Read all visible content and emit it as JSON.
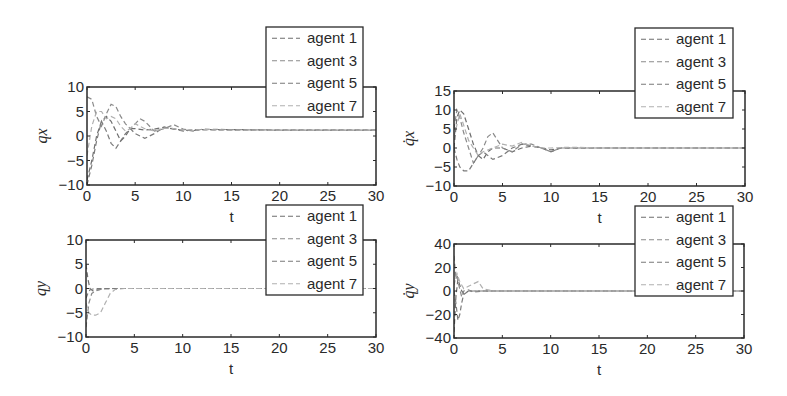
{
  "figure": {
    "background": "#ffffff",
    "axis_color": "#2a2a2a"
  },
  "chart_data": [
    {
      "type": "line",
      "id": "qx",
      "title": "",
      "xlabel": "t",
      "ylabel": "qx",
      "xlim": [
        0,
        30
      ],
      "ylim": [
        -10,
        10
      ],
      "xticks": [
        0,
        5,
        10,
        15,
        20,
        25,
        30
      ],
      "yticks": [
        -10,
        -5,
        0,
        5,
        10
      ],
      "xtick_labels": [
        "0",
        "5",
        "10",
        "15",
        "20",
        "25",
        "30"
      ],
      "ytick_labels": [
        "−10",
        "−5",
        "0",
        "5",
        "10"
      ],
      "grid": false,
      "legend_position": "top-right (overflowing above axes)",
      "box": {
        "left": 87,
        "top": 87,
        "right": 376,
        "bottom": 185
      },
      "legend_box": {
        "left": 266,
        "top": 27,
        "right": 363,
        "bottom": 117
      },
      "series": [
        {
          "name": "agent 1",
          "color": "#6e6e6e",
          "style": "dashed",
          "x": [
            0,
            0.5,
            1,
            1.5,
            2,
            2.5,
            3,
            3.5,
            4,
            4.5,
            5,
            6,
            7,
            8,
            9,
            10,
            11,
            12,
            15,
            20,
            30
          ],
          "y": [
            -9,
            -5,
            0,
            3,
            4,
            3,
            1,
            -1,
            0,
            1.5,
            1.5,
            1.2,
            1.4,
            1.8,
            1.4,
            1.2,
            1.1,
            1.3,
            1.3,
            1.2,
            1.2
          ]
        },
        {
          "name": "agent 3",
          "color": "#8a8a8a",
          "style": "dashed",
          "x": [
            0,
            0.5,
            1,
            1.5,
            2,
            2.5,
            3,
            3.5,
            4,
            4.5,
            5,
            5.5,
            6,
            7,
            8,
            9,
            10,
            11,
            12,
            15,
            20,
            30
          ],
          "y": [
            8,
            7.5,
            4,
            2,
            4.5,
            6.5,
            6,
            4,
            2.5,
            1.5,
            2.5,
            3.5,
            3,
            1,
            1.5,
            2.3,
            1.4,
            1.0,
            1.4,
            1.3,
            1.2,
            1.2
          ]
        },
        {
          "name": "agent 5",
          "color": "#7a7a7a",
          "style": "dashed",
          "x": [
            0,
            0.5,
            1,
            1.5,
            2,
            2.5,
            3,
            3.5,
            4,
            4.5,
            5,
            6,
            7,
            8,
            9,
            10,
            11,
            12,
            15,
            20,
            30
          ],
          "y": [
            -10,
            -6,
            -1,
            3,
            1,
            -1.5,
            -2.5,
            -1,
            0.5,
            1.5,
            0.5,
            -0.5,
            0.5,
            1.8,
            1.5,
            1.0,
            1.3,
            1.3,
            1.2,
            1.2,
            1.2
          ]
        },
        {
          "name": "agent 7",
          "color": "#b0b0b0",
          "style": "dashed",
          "x": [
            0,
            0.5,
            1,
            1.5,
            2,
            2.5,
            3,
            3.5,
            4,
            4.5,
            5,
            6,
            7,
            8,
            9,
            10,
            12,
            15,
            20,
            30
          ],
          "y": [
            -4,
            2,
            5,
            5,
            3.5,
            4,
            3.5,
            2,
            1,
            1.5,
            2.5,
            1.5,
            1.0,
            1.6,
            1.5,
            1.2,
            1.3,
            1.2,
            1.2,
            1.2
          ]
        }
      ]
    },
    {
      "type": "line",
      "id": "qdotx",
      "title": "",
      "xlabel": "t",
      "ylabel": "q̇x",
      "xlim": [
        0,
        30
      ],
      "ylim": [
        -10,
        15
      ],
      "xticks": [
        0,
        5,
        10,
        15,
        20,
        25,
        30
      ],
      "yticks": [
        -10,
        -5,
        0,
        5,
        10,
        15
      ],
      "xtick_labels": [
        "0",
        "5",
        "10",
        "15",
        "20",
        "25",
        "30"
      ],
      "ytick_labels": [
        "−10",
        "−5",
        "0",
        "5",
        "10",
        "15"
      ],
      "grid": false,
      "legend_position": "top-right (overflowing above axes)",
      "box": {
        "left": 454,
        "top": 91,
        "right": 745,
        "bottom": 186
      },
      "legend_box": {
        "left": 635,
        "top": 28,
        "right": 733,
        "bottom": 118
      },
      "series": [
        {
          "name": "agent 1",
          "color": "#6e6e6e",
          "style": "dashed",
          "x": [
            0,
            0.3,
            0.6,
            1,
            1.5,
            2,
            2.5,
            3,
            3.5,
            4,
            5,
            6,
            7,
            8,
            9,
            10,
            11,
            12,
            15,
            20,
            30
          ],
          "y": [
            0,
            8,
            10,
            9,
            5,
            1,
            -2,
            -3,
            -1,
            0,
            0,
            -1,
            0,
            0.5,
            0,
            -0.5,
            0,
            0,
            0,
            0,
            0
          ]
        },
        {
          "name": "agent 3",
          "color": "#8a8a8a",
          "style": "dashed",
          "x": [
            0,
            0.3,
            0.6,
            1,
            1.5,
            2,
            2.5,
            3,
            3.5,
            4,
            4.5,
            5,
            6,
            7,
            8,
            9,
            10,
            11,
            12,
            15,
            20,
            30
          ],
          "y": [
            5,
            10,
            8,
            4,
            0,
            -4,
            -2,
            0,
            3,
            4,
            2,
            0,
            -1,
            1,
            1,
            0,
            -1,
            0,
            0,
            0,
            0,
            0
          ]
        },
        {
          "name": "agent 5",
          "color": "#7a7a7a",
          "style": "dashed",
          "x": [
            0,
            0.3,
            0.6,
            1,
            1.5,
            2,
            2.5,
            3,
            4,
            5,
            6,
            7,
            8,
            9,
            10,
            11,
            12,
            15,
            20,
            30
          ],
          "y": [
            0,
            -3,
            -5,
            -6,
            -6,
            -4,
            -2,
            -1,
            -3,
            -2,
            0,
            1,
            0.5,
            0,
            -1,
            0,
            0,
            0,
            0,
            0
          ]
        },
        {
          "name": "agent 7",
          "color": "#b0b0b0",
          "style": "dashed",
          "x": [
            0,
            0.3,
            0.6,
            1,
            1.5,
            2,
            2.5,
            3,
            4,
            5,
            6,
            7,
            8,
            9,
            10,
            12,
            15,
            20,
            30
          ],
          "y": [
            3,
            6,
            9,
            6,
            2,
            0,
            -2,
            -1,
            0,
            1,
            0.5,
            1.5,
            0.5,
            0,
            0,
            0.2,
            0,
            0,
            0
          ]
        }
      ]
    },
    {
      "type": "line",
      "id": "qy",
      "title": "",
      "xlabel": "t",
      "ylabel": "qy",
      "xlim": [
        0,
        30
      ],
      "ylim": [
        -10,
        10
      ],
      "xticks": [
        0,
        5,
        10,
        15,
        20,
        25,
        30
      ],
      "yticks": [
        -10,
        -5,
        0,
        5,
        10
      ],
      "xtick_labels": [
        "0",
        "5",
        "10",
        "15",
        "20",
        "25",
        "30"
      ],
      "ytick_labels": [
        "−10",
        "−5",
        "0",
        "5",
        "10"
      ],
      "grid": false,
      "legend_position": "top-right (overflowing above axes)",
      "box": {
        "left": 86,
        "top": 240,
        "right": 376,
        "bottom": 337
      },
      "legend_box": {
        "left": 266,
        "top": 205,
        "right": 363,
        "bottom": 295
      },
      "series": [
        {
          "name": "agent 1",
          "color": "#6e6e6e",
          "style": "dashed",
          "x": [
            0,
            0.2,
            0.4,
            0.7,
            1,
            1.5,
            2,
            3,
            5,
            10,
            30
          ],
          "y": [
            5,
            2,
            0,
            -0.5,
            -0.3,
            -0.2,
            0,
            0,
            0,
            0,
            0
          ]
        },
        {
          "name": "agent 3",
          "color": "#8a8a8a",
          "style": "dashed",
          "x": [
            0,
            0.3,
            0.6,
            1,
            1.5,
            2,
            3,
            5,
            10,
            30
          ],
          "y": [
            -8,
            -3,
            -1,
            -0.5,
            -0.2,
            -0.1,
            0,
            0,
            0,
            0
          ]
        },
        {
          "name": "agent 5",
          "color": "#7a7a7a",
          "style": "dashed",
          "x": [
            0,
            0.2,
            0.4,
            0.7,
            1,
            2,
            5,
            10,
            30
          ],
          "y": [
            -2,
            -1,
            -0.3,
            -0.1,
            0,
            0,
            0,
            0,
            0
          ]
        },
        {
          "name": "agent 7",
          "color": "#b0b0b0",
          "style": "dashed",
          "x": [
            0,
            0.3,
            0.6,
            1,
            1.5,
            2,
            2.5,
            3,
            4,
            5,
            10,
            30
          ],
          "y": [
            -3,
            -5,
            -5.5,
            -5.5,
            -5,
            -3,
            -1,
            -0.2,
            0,
            0,
            0,
            0
          ]
        }
      ]
    },
    {
      "type": "line",
      "id": "qdoty",
      "title": "",
      "xlabel": "t",
      "ylabel": "q̇y",
      "xlim": [
        0,
        30
      ],
      "ylim": [
        -40,
        40
      ],
      "xticks": [
        0,
        5,
        10,
        15,
        20,
        25,
        30
      ],
      "yticks": [
        -40,
        -20,
        0,
        20,
        40
      ],
      "xtick_labels": [
        "0",
        "5",
        "10",
        "15",
        "20",
        "25",
        "30"
      ],
      "ytick_labels": [
        "−40",
        "−20",
        "0",
        "20",
        "40"
      ],
      "grid": false,
      "legend_position": "top-right (overflowing above axes)",
      "box": {
        "left": 454,
        "top": 244,
        "right": 744,
        "bottom": 338
      },
      "legend_box": {
        "left": 635,
        "top": 206,
        "right": 733,
        "bottom": 296
      },
      "series": [
        {
          "name": "agent 1",
          "color": "#6e6e6e",
          "style": "dashed",
          "x": [
            0,
            0.1,
            0.2,
            0.4,
            0.6,
            0.8,
            1,
            1.5,
            2,
            3,
            5,
            10,
            30
          ],
          "y": [
            -35,
            -20,
            -5,
            10,
            5,
            0,
            -2,
            0,
            0,
            0,
            0,
            0,
            0
          ]
        },
        {
          "name": "agent 3",
          "color": "#8a8a8a",
          "style": "dashed",
          "x": [
            0,
            0.1,
            0.2,
            0.3,
            0.5,
            0.8,
            1,
            1.5,
            2,
            3,
            5,
            10,
            30
          ],
          "y": [
            30,
            20,
            10,
            15,
            5,
            -5,
            0,
            1,
            -1,
            0,
            0,
            0,
            0
          ]
        },
        {
          "name": "agent 5",
          "color": "#7a7a7a",
          "style": "dashed",
          "x": [
            0,
            0.2,
            0.4,
            0.6,
            0.8,
            1,
            1.5,
            2,
            3,
            5,
            10,
            30
          ],
          "y": [
            0,
            -10,
            -25,
            -20,
            -10,
            -3,
            0,
            0,
            0,
            0,
            0,
            0
          ]
        },
        {
          "name": "agent 7",
          "color": "#b0b0b0",
          "style": "dashed",
          "x": [
            0,
            0.3,
            0.6,
            1,
            1.5,
            2,
            2.5,
            3,
            4,
            5,
            10,
            30
          ],
          "y": [
            5,
            15,
            8,
            2,
            4,
            6,
            8,
            2,
            0,
            0,
            0,
            0
          ]
        }
      ]
    }
  ]
}
